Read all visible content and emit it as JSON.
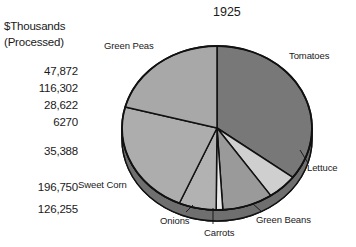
{
  "title": "1925",
  "legend": {
    "header_line1": "$Thousands",
    "header_line2": "(Processed)",
    "values": [
      {
        "label": "47,872"
      },
      {
        "label": "116,302"
      },
      {
        "label": "28,622"
      },
      {
        "label": "6270"
      },
      {
        "label": "35,388"
      },
      {
        "label": "196,750"
      },
      {
        "label": "126,255"
      }
    ]
  },
  "labels": {
    "green_peas": "Green Peas",
    "tomatoes": "Tomatoes",
    "lettuce": "Lettuce",
    "green_beans": "Green Beans",
    "carrots": "Carrots",
    "onions": "Onions",
    "sweet_corn": "Sweet Corn"
  },
  "colors": {
    "tomatoes": "#787878",
    "lettuce": "#cfcfcf",
    "green_beans": "#9a9a9a",
    "carrots": "#e8e8e8",
    "onions": "#b2b2b2",
    "sweet_corn": "#adadad",
    "green_peas": "#a8a8a8",
    "rim": "#6f6f6f",
    "outline": "#111111",
    "background": "#ffffff",
    "text": "#1a1a1a"
  },
  "chart_data": {
    "type": "pie",
    "title": "1925",
    "unit": "$Thousands (Processed)",
    "categories": [
      "Tomatoes",
      "Sweet Corn",
      "Green Peas",
      "Green Beans",
      "Onions",
      "Lettuce",
      "Carrots"
    ],
    "values": [
      196750,
      126255,
      116302,
      47872,
      35388,
      28622,
      6270
    ],
    "value_labels": [
      "196,750",
      "126,255",
      "116,302",
      "47,872",
      "35,388",
      "28,622",
      "6270"
    ],
    "percentages": [
      35.3,
      22.6,
      20.9,
      8.6,
      6.3,
      5.1,
      1.1
    ],
    "total": 557459,
    "legend_column_order": [
      "47,872",
      "116,302",
      "28,622",
      "6270",
      "35,388",
      "196,750",
      "126,255"
    ],
    "three_d": true,
    "legend_position": "left",
    "grid": false,
    "xlabel": "",
    "ylabel": ""
  }
}
